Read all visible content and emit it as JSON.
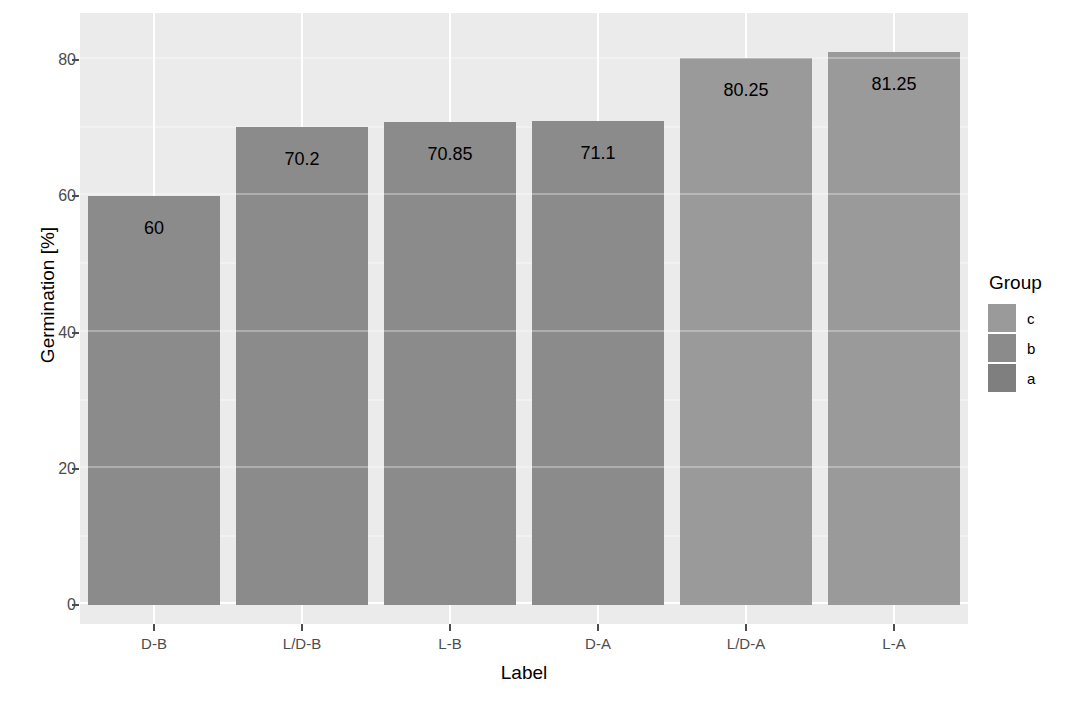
{
  "chart_data": {
    "type": "bar",
    "title": "",
    "subtitle": "",
    "xlabel": "Label",
    "ylabel": "Germination [%]",
    "categories": [
      "D-B",
      "L/D-B",
      "L-B",
      "D-A",
      "L/D-A",
      "L-A"
    ],
    "values": [
      60,
      70.2,
      70.85,
      71.1,
      80.25,
      81.25
    ],
    "value_labels": [
      "60",
      "70.2",
      "70.85",
      "71.1",
      "80.25",
      "81.25"
    ],
    "group_by_category": [
      "b",
      "b",
      "b",
      "b",
      "c",
      "c"
    ],
    "ylim": [
      0,
      85
    ],
    "y_ticks": [
      0,
      20,
      40,
      60,
      80
    ],
    "y_tick_labels": [
      "0",
      "20",
      "40",
      "60",
      "80"
    ],
    "y_minor_ticks": [
      10,
      30,
      50,
      70
    ],
    "grid": true,
    "legend_position": "right",
    "legend": {
      "title": "Group",
      "entries": [
        {
          "label": "c",
          "color": "#9a9a9a"
        },
        {
          "label": "b",
          "color": "#8b8b8b"
        },
        {
          "label": "a",
          "color": "#7f7f7f"
        }
      ]
    },
    "colors": {
      "panel_background": "#ebebeb",
      "gridline_major": "#ffffff",
      "gridline_minor": "#f7f7f7",
      "bar_group_b": "#8b8b8b",
      "bar_group_c": "#9a9a9a",
      "axis_text": "#4d4d4d",
      "title_text": "#000000",
      "page_background": "#ffffff"
    }
  },
  "axes": {
    "y": {
      "title": "Germination [%]",
      "ticks": [
        {
          "label": "80",
          "value": 80
        },
        {
          "label": "60",
          "value": 60
        },
        {
          "label": "40",
          "value": 40
        },
        {
          "label": "20",
          "value": 20
        },
        {
          "label": "0",
          "value": 0
        }
      ]
    },
    "x": {
      "title": "Label",
      "ticks": [
        {
          "label": "D-B"
        },
        {
          "label": "L/D-B"
        },
        {
          "label": "L-B"
        },
        {
          "label": "D-A"
        },
        {
          "label": "L/D-A"
        },
        {
          "label": "L-A"
        }
      ]
    }
  },
  "bars": [
    {
      "category": "D-B",
      "value": 60,
      "label": "60",
      "group": "b",
      "color": "#8b8b8b"
    },
    {
      "category": "L/D-B",
      "value": 70.2,
      "label": "70.2",
      "group": "b",
      "color": "#8b8b8b"
    },
    {
      "category": "L-B",
      "value": 70.85,
      "label": "70.85",
      "group": "b",
      "color": "#8b8b8b"
    },
    {
      "category": "D-A",
      "value": 71.1,
      "label": "71.1",
      "group": "b",
      "color": "#8b8b8b"
    },
    {
      "category": "L/D-A",
      "value": 80.25,
      "label": "80.25",
      "group": "c",
      "color": "#9a9a9a"
    },
    {
      "category": "L-A",
      "value": 81.25,
      "label": "81.25",
      "group": "c",
      "color": "#9a9a9a"
    }
  ],
  "legend": {
    "title": "Group",
    "items": [
      {
        "label": "c",
        "color": "#9a9a9a"
      },
      {
        "label": "b",
        "color": "#8b8b8b"
      },
      {
        "label": "a",
        "color": "#7f7f7f"
      }
    ]
  }
}
